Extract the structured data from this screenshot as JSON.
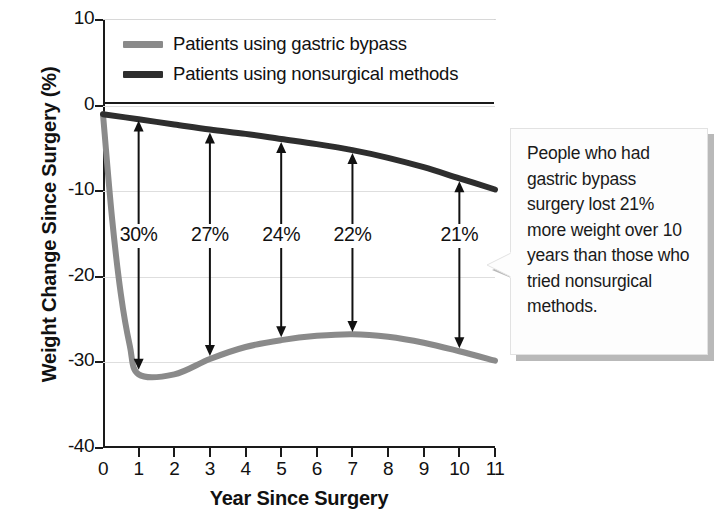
{
  "chart_data": {
    "type": "line",
    "title": "",
    "xlabel": "Year Since Surgery",
    "ylabel": "Weight Change Since Surgery (%)",
    "xlim": [
      0,
      11
    ],
    "ylim": [
      -40,
      10
    ],
    "xticks": [
      "0",
      "1",
      "2",
      "3",
      "4",
      "5",
      "6",
      "7",
      "8",
      "9",
      "10",
      "11"
    ],
    "yticks": [
      "10",
      "0",
      "-10",
      "-20",
      "-30",
      "-40"
    ],
    "grid": true,
    "legend_position": "top-left inside plot",
    "series": [
      {
        "name": "Patients using gastric bypass",
        "color": "#8a8a8a",
        "x": [
          0,
          0.25,
          0.5,
          0.75,
          1,
          2,
          3,
          4,
          5,
          6,
          7,
          8,
          9,
          10,
          11
        ],
        "values": [
          -1.0,
          -13.0,
          -22.0,
          -28.0,
          -31.4,
          -31.4,
          -29.6,
          -28.2,
          -27.4,
          -26.9,
          -26.7,
          -27.0,
          -27.7,
          -28.7,
          -29.8
        ]
      },
      {
        "name": "Patients using nonsurgical methods",
        "color": "#2e2e2e",
        "x": [
          0,
          1,
          2,
          3,
          4,
          5,
          6,
          7,
          8,
          9,
          10,
          11
        ],
        "values": [
          -1.0,
          -1.6,
          -2.2,
          -2.8,
          -3.3,
          -3.9,
          -4.5,
          -5.2,
          -6.1,
          -7.2,
          -8.5,
          -9.8
        ]
      }
    ],
    "annotations": [
      {
        "label": "30%",
        "x": 1,
        "top_value": -1.4,
        "bottom_value": -31.2
      },
      {
        "label": "27%",
        "x": 3,
        "top_value": -2.8,
        "bottom_value": -29.6
      },
      {
        "label": "24%",
        "x": 5,
        "top_value": -3.9,
        "bottom_value": -27.4
      },
      {
        "label": "22%",
        "x": 7,
        "top_value": -5.2,
        "bottom_value": -26.8
      },
      {
        "label": "21%",
        "x": 10,
        "top_value": -8.5,
        "bottom_value": -28.7
      }
    ]
  },
  "legend": {
    "items": [
      {
        "label": "Patients using gastric bypass",
        "color": "#8a8a8a"
      },
      {
        "label": "Patients using nonsurgical methods",
        "color": "#2e2e2e"
      }
    ]
  },
  "callout": {
    "text": "People who had gastric bypass surgery lost 21% more weight over 10 years than those who tried nonsurgical methods."
  },
  "colors": {
    "gastric_bypass_line": "#8a8a8a",
    "nonsurgical_line": "#2e2e2e",
    "axis": "#1a1a1a",
    "gridline": "#dedede",
    "callout_background": "#fdfdfd",
    "callout_shadow": "#b9b9b9"
  }
}
